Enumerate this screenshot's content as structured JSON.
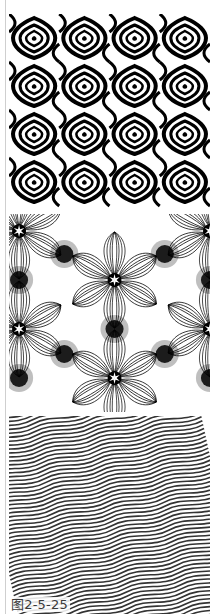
{
  "figure": {
    "caption": "图2-5-25",
    "panels": [
      {
        "id": "panel-1",
        "pattern": "wavy-concentric-tiles",
        "description": "Black and white warped concentric diamond tiles in a 4×4 grid"
      },
      {
        "id": "panel-2",
        "pattern": "hexagonal-star-line-moire",
        "description": "Fine line pattern with six-pointed stars at hexagon centers"
      },
      {
        "id": "panel-3",
        "pattern": "diagonal-wave-stripes",
        "description": "Dense parallel wavy lines rising diagonally"
      }
    ],
    "colors": {
      "ink": "#000000",
      "paper": "#ffffff",
      "rule": "#cfcfcf",
      "caption": "#3a3a3a"
    }
  }
}
